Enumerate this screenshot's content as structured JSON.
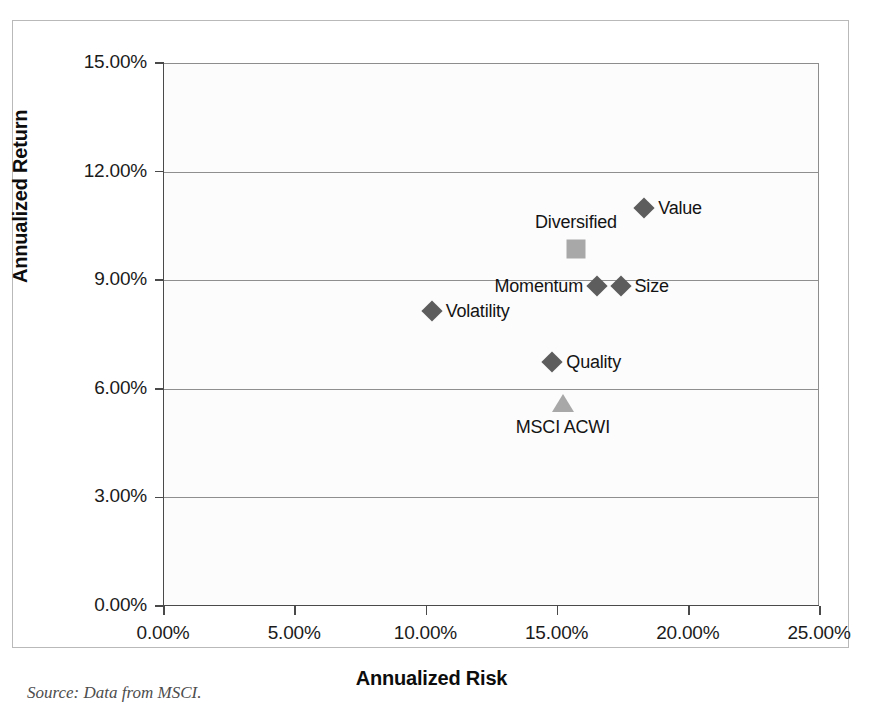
{
  "source_note": "Source: Data from MSCI.",
  "chart_data": {
    "type": "scatter",
    "title": "",
    "xlabel": "Annualized Risk",
    "ylabel": "Annualized Return",
    "xlim": [
      0,
      25
    ],
    "ylim": [
      0,
      15
    ],
    "grid": true,
    "legend_position": "none",
    "x_ticks": [
      "0.00%",
      "5.00%",
      "10.00%",
      "15.00%",
      "20.00%",
      "25.00%"
    ],
    "x_tick_values": [
      0,
      5,
      10,
      15,
      20,
      25
    ],
    "y_ticks": [
      "0.00%",
      "3.00%",
      "6.00%",
      "9.00%",
      "12.00%",
      "15.00%"
    ],
    "y_tick_values": [
      0,
      3,
      6,
      9,
      12,
      15
    ],
    "points": [
      {
        "name": "Value",
        "x": 18.3,
        "y": 11.0,
        "marker": "diamond",
        "color": "#5d5d5d",
        "label_pos": "right"
      },
      {
        "name": "Diversified",
        "x": 15.7,
        "y": 9.85,
        "marker": "square",
        "color": "#a8a8a8",
        "label_pos": "above"
      },
      {
        "name": "Size",
        "x": 17.4,
        "y": 8.85,
        "marker": "diamond",
        "color": "#5d5d5d",
        "label_pos": "right"
      },
      {
        "name": "Momentum",
        "x": 16.5,
        "y": 8.85,
        "marker": "diamond",
        "color": "#5d5d5d",
        "label_pos": "left"
      },
      {
        "name": "Volatility",
        "x": 10.2,
        "y": 8.15,
        "marker": "diamond",
        "color": "#5d5d5d",
        "label_pos": "right"
      },
      {
        "name": "Quality",
        "x": 14.8,
        "y": 6.75,
        "marker": "diamond",
        "color": "#5d5d5d",
        "label_pos": "right"
      },
      {
        "name": "MSCI ACWI",
        "x": 15.2,
        "y": 5.6,
        "marker": "triangle",
        "color": "#a8a8a8",
        "label_pos": "below"
      }
    ]
  }
}
